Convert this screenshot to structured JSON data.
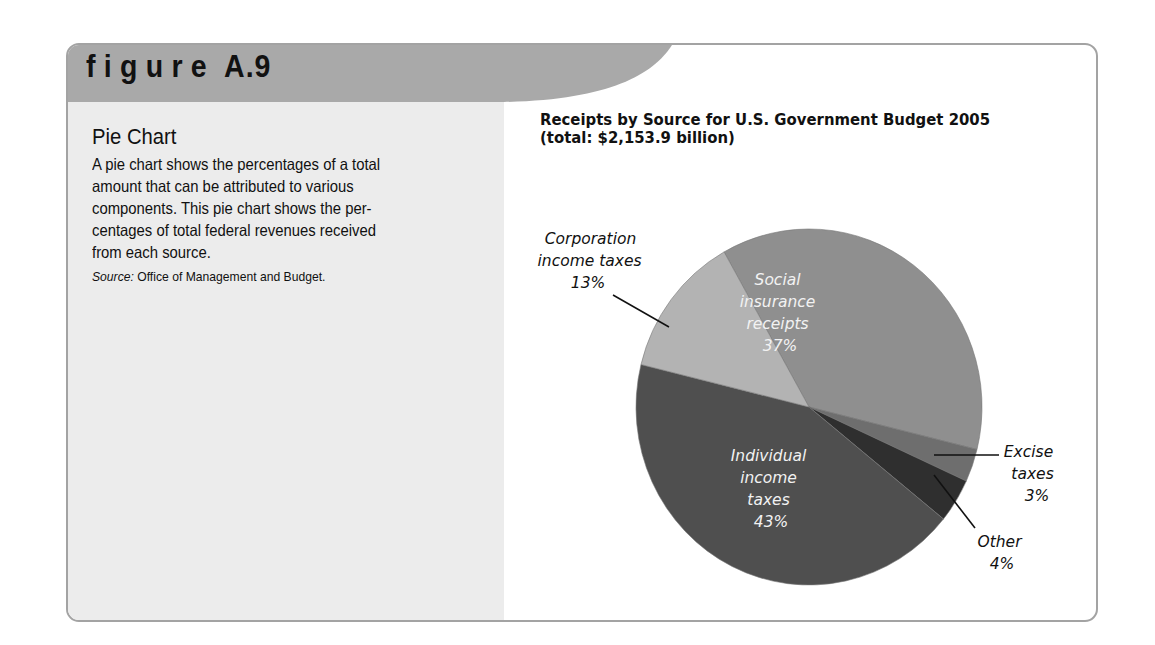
{
  "figure": {
    "word": "figure",
    "number": "A.9",
    "header_color": "#a9a9a9",
    "panel_color": "#ececec",
    "border_color": "#a3a3a3"
  },
  "panel": {
    "title": "Pie Chart",
    "body_lines": [
      "A pie chart shows the percentages of a total",
      "amount that can be attributed to various",
      "components. This pie chart shows the per-",
      "centages of total federal revenues received",
      "from each source."
    ],
    "source_label": "Source:",
    "source_text": " Office of Management and Budget."
  },
  "chart_data": {
    "type": "pie",
    "title": "Receipts by Source for U.S. Government Budget 2005",
    "subtitle": "(total: $2,153.9 billion)",
    "total": 2153.9,
    "unit": "billion dollars",
    "start_angle_deg": 330.6,
    "categories": [
      "Social insurance receipts",
      "Excise taxes",
      "Other",
      "Individual income taxes",
      "Corporation income taxes"
    ],
    "values": [
      37,
      3,
      4,
      43,
      13
    ],
    "colors": [
      "#8f8f8f",
      "#6e6e6e",
      "#2f2f2f",
      "#4f4f4f",
      "#b3b3b3"
    ],
    "labels": [
      {
        "lines": [
          "Social",
          "insurance",
          "receipts",
          "37%"
        ],
        "inside": true
      },
      {
        "lines": [
          "Excise",
          "taxes",
          "3%"
        ],
        "inside": false
      },
      {
        "lines": [
          "Other",
          "4%"
        ],
        "inside": false
      },
      {
        "lines": [
          "Individual",
          "income",
          "taxes",
          "43%"
        ],
        "inside": true
      },
      {
        "lines": [
          "Corporation",
          "income taxes",
          "13%"
        ],
        "inside": false
      }
    ],
    "legend": "none (direct labels)"
  }
}
